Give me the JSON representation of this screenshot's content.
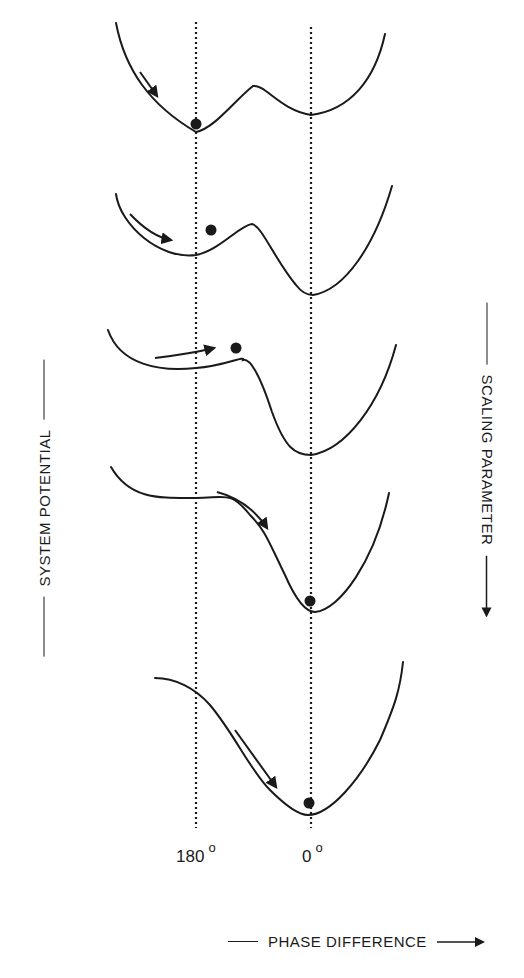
{
  "figure": {
    "type": "potential-landscape-diagram",
    "y_axis_label": "SYSTEM POTENTIAL",
    "right_axis_label": "SCALING PARAMETER",
    "right_axis_direction": "down",
    "x_axis_label": "PHASE DIFFERENCE",
    "x_axis_direction": "right",
    "phase_markers": [
      {
        "label": "180",
        "unit": "o"
      },
      {
        "label": "0",
        "unit": "o"
      }
    ],
    "panels": [
      {
        "index": 1,
        "description": "Bistable potential: deep minimum at 180°, shallower minimum at 0°; ball rests at 180° minimum; arrow shows descent into 180° well"
      },
      {
        "index": 2,
        "description": "180° well becomes shallow shoulder; 0° minimum deepens; ball sits near hump right of 180°; arrow moves toward 180°"
      },
      {
        "index": 3,
        "description": "180° well nearly vanished (plateau); ball at top of shoulder; arrow pushes right toward 0°"
      },
      {
        "index": 4,
        "description": "Monostable: flat plateau at 180°, single minimum at 0°; ball rests at 0°; arrow descends slope"
      },
      {
        "index": 5,
        "description": "Single parabolic minimum at 0°; ball at 0°; arrow descends toward minimum"
      }
    ]
  },
  "colors": {
    "ink": "#1a1a1a",
    "background": "#ffffff"
  }
}
